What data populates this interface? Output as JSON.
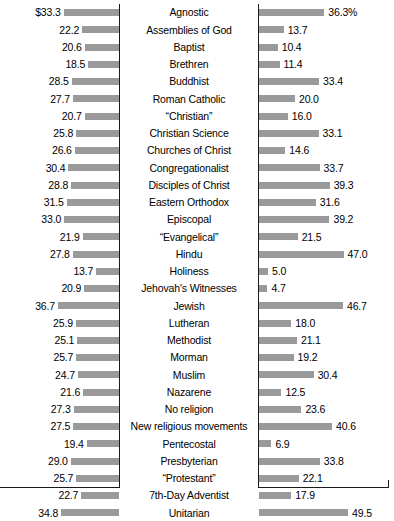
{
  "chart_data": {
    "type": "bar",
    "title": "",
    "subtitle": "",
    "xlabel": "",
    "ylabel": "",
    "orientation": "horizontal-diverging",
    "grid": false,
    "legend_position": "none",
    "left_axis": {
      "label": "",
      "direction": "right-to-left",
      "unit": "$",
      "range": [
        0,
        36.7
      ],
      "max_bar_px": 61
    },
    "right_axis": {
      "label": "",
      "direction": "left-to-right",
      "unit": "%",
      "range": [
        0,
        49.5
      ],
      "max_bar_px": 89
    },
    "categories": [
      "Agnostic",
      "Assemblies of God",
      "Baptist",
      "Brethren",
      "Buddhist",
      "Roman Catholic",
      "“Christian”",
      "Christian Science",
      "Churches of Christ",
      "Congregationalist",
      "Disciples of Christ",
      "Eastern Orthodox",
      "Episcopal",
      "“Evangelical”",
      "Hindu",
      "Holiness",
      "Jehovah's Witnesses",
      "Jewish",
      "Lutheran",
      "Methodist",
      "Morman",
      "Muslim",
      "Nazarene",
      "No religion",
      "New religious movements",
      "Pentecostal",
      "Presbyterian",
      "“Protestant”",
      "7th-Day Adventist",
      "Unitarian"
    ],
    "series": [
      {
        "name": "left",
        "side": "left",
        "values": [
          33.3,
          22.2,
          20.6,
          18.5,
          28.5,
          27.7,
          20.7,
          25.8,
          26.6,
          30.4,
          28.8,
          31.5,
          33.0,
          21.9,
          27.8,
          13.7,
          20.9,
          36.7,
          25.9,
          25.1,
          25.7,
          24.7,
          21.6,
          27.3,
          27.5,
          19.4,
          29.0,
          25.7,
          22.7,
          34.8
        ],
        "labels": [
          "$33.3",
          "22.2",
          "20.6",
          "18.5",
          "28.5",
          "27.7",
          "20.7",
          "25.8",
          "26.6",
          "30.4",
          "28.8",
          "31.5",
          "33.0",
          "21.9",
          "27.8",
          "13.7",
          "20.9",
          "36.7",
          "25.9",
          "25.1",
          "25.7",
          "24.7",
          "21.6",
          "27.3",
          "27.5",
          "19.4",
          "29.0",
          "25.7",
          "22.7",
          "34.8"
        ]
      },
      {
        "name": "right",
        "side": "right",
        "values": [
          36.3,
          13.7,
          10.4,
          11.4,
          33.4,
          20.0,
          16.0,
          33.1,
          14.6,
          33.7,
          39.3,
          31.6,
          39.2,
          21.5,
          47.0,
          5.0,
          4.7,
          46.7,
          18.0,
          21.1,
          19.2,
          30.4,
          12.5,
          23.6,
          40.6,
          6.9,
          33.8,
          22.1,
          17.9,
          49.5
        ],
        "labels": [
          "36.3%",
          "13.7",
          "10.4",
          "11.4",
          "33.4",
          "20.0",
          "16.0",
          "33.1",
          "14.6",
          "33.7",
          "39.3",
          "31.6",
          "39.2",
          "21.5",
          "47.0",
          "5.0",
          "4.7",
          "46.7",
          "18.0",
          "21.1",
          "19.2",
          "30.4",
          "12.5",
          "23.6",
          "40.6",
          "6.9",
          "33.8",
          "22.1",
          "17.9",
          "49.5"
        ]
      }
    ],
    "colors": {
      "bar": "#9a9a9a",
      "frame": "#1a1a1a",
      "text": "#000000",
      "background": "#ffffff"
    }
  }
}
